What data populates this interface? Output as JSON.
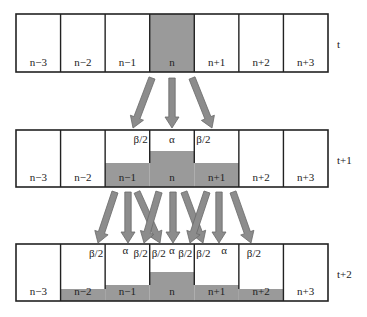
{
  "diagram": {
    "colors": {
      "cell_fill": "#ffffff",
      "shaded_fill": "#9a9a9a",
      "border": "#222222",
      "arrow_fill": "#8c8c8c",
      "arrow_stroke": "#6a6a6a"
    },
    "cell_labels": [
      "n−3",
      "n−2",
      "n−1",
      "n",
      "n+1",
      "n+2",
      "n+3"
    ],
    "rows": [
      {
        "time_label": "t",
        "top": 14,
        "bottom": 72,
        "shade_tops": [
          null,
          null,
          null,
          14,
          null,
          null,
          null
        ],
        "annotations": []
      },
      {
        "time_label": "t+1",
        "top": 130,
        "bottom": 187,
        "shade_tops": [
          null,
          null,
          163,
          151,
          163,
          null,
          null
        ],
        "annotations": [
          {
            "cell": 2,
            "text": "β/2",
            "align": "right"
          },
          {
            "cell": 3,
            "text": "α",
            "align": "center"
          },
          {
            "cell": 4,
            "text": "β/2",
            "align": "left"
          }
        ]
      },
      {
        "time_label": "t+2",
        "top": 244,
        "bottom": 301,
        "shade_tops": [
          null,
          289,
          285,
          272,
          285,
          289,
          null
        ],
        "annotations": [
          {
            "cell": 1,
            "text": "β/2",
            "align": "right"
          },
          {
            "cell": 2,
            "text": "α",
            "align": "alpha-left"
          },
          {
            "cell": 2,
            "text": "β/2",
            "align": "right"
          },
          {
            "cell": 3,
            "text": "β/2",
            "align": "left"
          },
          {
            "cell": 3,
            "text": "α",
            "align": "center-alpha"
          },
          {
            "cell": 3,
            "text": "β/2",
            "align": "right"
          },
          {
            "cell": 4,
            "text": "β/2",
            "align": "left"
          },
          {
            "cell": 4,
            "text": "α",
            "align": "alpha-right"
          },
          {
            "cell": 5,
            "text": "β/2",
            "align": "left-inset"
          }
        ]
      }
    ],
    "arrows": [
      {
        "from": [
          152,
          78
        ],
        "to": [
          133,
          128
        ]
      },
      {
        "from": [
          172,
          78
        ],
        "to": [
          172,
          128
        ]
      },
      {
        "from": [
          192,
          78
        ],
        "to": [
          212,
          128
        ]
      },
      {
        "from": [
          115,
          192
        ],
        "to": [
          98,
          243
        ]
      },
      {
        "from": [
          128,
          192
        ],
        "to": [
          128,
          243
        ]
      },
      {
        "from": [
          137,
          192
        ],
        "to": [
          160,
          243
        ]
      },
      {
        "from": [
          159,
          192
        ],
        "to": [
          144,
          243
        ]
      },
      {
        "from": [
          173,
          192
        ],
        "to": [
          173,
          243
        ]
      },
      {
        "from": [
          184,
          192
        ],
        "to": [
          203,
          243
        ]
      },
      {
        "from": [
          207,
          192
        ],
        "to": [
          190,
          243
        ]
      },
      {
        "from": [
          219,
          192
        ],
        "to": [
          219,
          243
        ]
      },
      {
        "from": [
          233,
          192
        ],
        "to": [
          251,
          243
        ]
      }
    ]
  }
}
